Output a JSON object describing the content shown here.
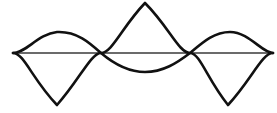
{
  "figure": {
    "background_color": "#ffffff",
    "width": 277,
    "height": 113
  },
  "axis": {
    "name": "horizontal-axis",
    "color": "#3a3a3a",
    "stroke_width": 1.6,
    "x_start": 13,
    "x_end": 273,
    "y": 53
  },
  "curves": [
    {
      "name": "large-wave",
      "label": "Large amplitude wave",
      "color": "#111111",
      "stroke_width": 2.6,
      "cycles": 1.5,
      "amplitude": 50,
      "phase": "negative-first",
      "nodes": [
        13,
        101,
        190,
        273
      ],
      "extrema": [
        {
          "type": "trough",
          "x": 57,
          "y": 106
        },
        {
          "type": "crest",
          "x": 145,
          "y": 3
        },
        {
          "type": "trough",
          "x": 228,
          "y": 106
        }
      ],
      "path": "M 13 53 C 24 53 32 79 57 105 C 80 79 91 53 101 53 C 112 53 122 27 145 3 C 169 27 179 53 190 53 C 200 53 207 79 228 105 C 252 79 262 53 273 53"
    },
    {
      "name": "small-wave",
      "label": "Small amplitude wave",
      "color": "#111111",
      "stroke_width": 2.6,
      "cycles": 1.0,
      "amplitude": 21,
      "phase": "positive-first",
      "nodes": [
        13,
        101,
        190,
        273
      ],
      "extrema": [
        {
          "type": "crest",
          "x": 57,
          "y": 32
        },
        {
          "type": "trough",
          "x": 145,
          "y": 72
        },
        {
          "type": "crest",
          "x": 230,
          "y": 32
        }
      ],
      "path": "M 13 53 C 26 53 38 34 57 32 C 77 31 90 43 101 53 C 114 64 128 72 145 72 C 163 72 177 63 190 53 C 203 42 214 32 230 32 C 249 32 262 53 273 53"
    }
  ],
  "chart_data": {
    "type": "line",
    "title": "",
    "xlabel": "",
    "ylabel": "",
    "grid": false,
    "legend": "none",
    "xlim": [
      13,
      273
    ],
    "ylim": [
      113,
      0
    ],
    "baseline_y": 53,
    "series": [
      {
        "name": "large-wave",
        "amplitude_px": 50,
        "cycles": 1.5,
        "points": [
          {
            "x": 13,
            "y": 53
          },
          {
            "x": 57,
            "y": 106
          },
          {
            "x": 101,
            "y": 53
          },
          {
            "x": 145,
            "y": 3
          },
          {
            "x": 190,
            "y": 53
          },
          {
            "x": 228,
            "y": 106
          },
          {
            "x": 273,
            "y": 53
          }
        ]
      },
      {
        "name": "small-wave",
        "amplitude_px": 21,
        "cycles": 1.0,
        "points": [
          {
            "x": 13,
            "y": 53
          },
          {
            "x": 57,
            "y": 32
          },
          {
            "x": 101,
            "y": 53
          },
          {
            "x": 145,
            "y": 72
          },
          {
            "x": 190,
            "y": 53
          },
          {
            "x": 230,
            "y": 32
          },
          {
            "x": 273,
            "y": 53
          }
        ]
      },
      {
        "name": "axis",
        "amplitude_px": 0,
        "cycles": 0,
        "points": [
          {
            "x": 13,
            "y": 53
          },
          {
            "x": 273,
            "y": 53
          }
        ]
      }
    ],
    "intersections": [
      {
        "x": 13,
        "y": 53
      },
      {
        "x": 101,
        "y": 53
      },
      {
        "x": 190,
        "y": 53
      },
      {
        "x": 273,
        "y": 53
      }
    ]
  }
}
